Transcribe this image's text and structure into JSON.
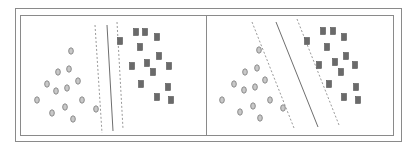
{
  "figure": {
    "colors": {
      "frame": "#8a8a8a",
      "circle_stroke": "#8c8c8c",
      "circle_fill": "#c8c8c8",
      "square_fill": "#6a6a6a",
      "line": "#6e6e6e",
      "dashed": "#9a9a9a"
    }
  },
  "panels": [
    {
      "name": "narrow-margin",
      "hyperplane": {
        "x1": 107,
        "y1": 25,
        "x2": 113,
        "y2": 131
      },
      "margin_left": {
        "x1": 95,
        "y1": 25,
        "x2": 102,
        "y2": 133
      },
      "margin_right": {
        "x1": 117,
        "y1": 22,
        "x2": 123,
        "y2": 129
      },
      "circles": [
        [
          71,
          51
        ],
        [
          69,
          69
        ],
        [
          58,
          72
        ],
        [
          78,
          81
        ],
        [
          47,
          84
        ],
        [
          56,
          91
        ],
        [
          67,
          88
        ],
        [
          37,
          100
        ],
        [
          82,
          100
        ],
        [
          52,
          113
        ],
        [
          65,
          107
        ],
        [
          73,
          119
        ],
        [
          96,
          109
        ]
      ],
      "squares": [
        [
          120,
          41
        ],
        [
          136,
          32
        ],
        [
          145,
          32
        ],
        [
          157,
          37
        ],
        [
          140,
          47
        ],
        [
          159,
          56
        ],
        [
          132,
          66
        ],
        [
          147,
          63
        ],
        [
          153,
          72
        ],
        [
          169,
          66
        ],
        [
          141,
          84
        ],
        [
          168,
          87
        ],
        [
          157,
          97
        ],
        [
          171,
          100
        ]
      ]
    },
    {
      "name": "wide-margin",
      "hyperplane": {
        "x1": 276,
        "y1": 22,
        "x2": 318,
        "y2": 127
      },
      "margin_left": {
        "x1": 252,
        "y1": 22,
        "x2": 294,
        "y2": 128
      },
      "margin_right": {
        "x1": 297,
        "y1": 19,
        "x2": 339,
        "y2": 125
      },
      "circles": [
        [
          259,
          50
        ],
        [
          245,
          72
        ],
        [
          257,
          68
        ],
        [
          234,
          84
        ],
        [
          244,
          90
        ],
        [
          255,
          87
        ],
        [
          265,
          80
        ],
        [
          222,
          100
        ],
        [
          270,
          100
        ],
        [
          240,
          112
        ],
        [
          253,
          106
        ],
        [
          260,
          118
        ],
        [
          283,
          108
        ]
      ],
      "squares": [
        [
          307,
          41
        ],
        [
          323,
          31
        ],
        [
          333,
          31
        ],
        [
          344,
          37
        ],
        [
          327,
          47
        ],
        [
          346,
          56
        ],
        [
          319,
          65
        ],
        [
          335,
          62
        ],
        [
          341,
          72
        ],
        [
          355,
          65
        ],
        [
          329,
          84
        ],
        [
          356,
          87
        ],
        [
          344,
          97
        ],
        [
          358,
          100
        ]
      ]
    }
  ]
}
